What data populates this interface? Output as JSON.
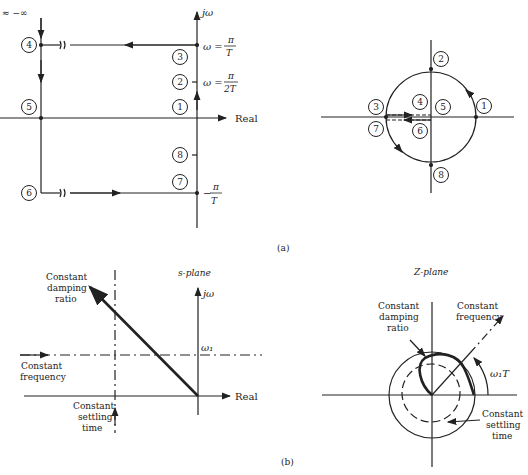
{
  "figure": {
    "part_a_label": "(a)",
    "part_b_label": "(b)"
  },
  "a_splane": {
    "top_left_label": "≈ −∞",
    "imag_axis_label": "jω",
    "real_axis_label": "Real",
    "omega_pi_T": "ω = π/T",
    "omega_pi_T_lhs": "ω =",
    "pi": "π",
    "T": "T",
    "twoT": "2T",
    "neg_pi_T_minus": "−",
    "points": [
      "1",
      "2",
      "3",
      "4",
      "5",
      "6",
      "7",
      "8"
    ]
  },
  "a_zplane": {
    "points": [
      "1",
      "2",
      "3",
      "4",
      "5",
      "6",
      "7",
      "8"
    ]
  },
  "b_splane": {
    "title": "s-plane",
    "imag_axis_label": "jω",
    "real_axis_label": "Real",
    "omega1": "ω₁",
    "damping_label": [
      "Constant",
      "damping",
      "ratio"
    ],
    "frequency_label": [
      "Constant",
      "frequency"
    ],
    "settling_label": [
      "Constant",
      "settling",
      "time"
    ]
  },
  "b_zplane": {
    "title": "Z-plane",
    "damping_label": [
      "Constant",
      "damping",
      "ratio"
    ],
    "frequency_label": [
      "Constant",
      "frequency"
    ],
    "angle_label": "ω₁T",
    "settling_label": [
      "Constant",
      "settling",
      "time"
    ]
  }
}
